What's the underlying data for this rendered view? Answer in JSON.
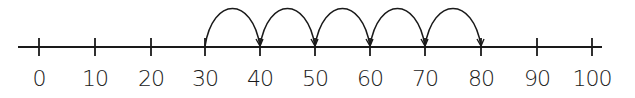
{
  "number_line": {
    "line": {
      "x_start": 18,
      "x_end": 602,
      "y": 47,
      "color": "#1a1a1a"
    },
    "ticks": [
      {
        "value": 0,
        "label": "0",
        "x": 39
      },
      {
        "value": 10,
        "label": "10",
        "x": 95
      },
      {
        "value": 20,
        "label": "20",
        "x": 151
      },
      {
        "value": 30,
        "label": "30",
        "x": 205
      },
      {
        "value": 40,
        "label": "40",
        "x": 260
      },
      {
        "value": 50,
        "label": "50",
        "x": 315
      },
      {
        "value": 60,
        "label": "60",
        "x": 370
      },
      {
        "value": 70,
        "label": "70",
        "x": 425
      },
      {
        "value": 80,
        "label": "80",
        "x": 481
      },
      {
        "value": 90,
        "label": "90",
        "x": 537
      },
      {
        "value": 100,
        "label": "100",
        "x": 592
      }
    ],
    "jumps": [
      {
        "from": 30,
        "to": 40
      },
      {
        "from": 40,
        "to": 50
      },
      {
        "from": 50,
        "to": 60
      },
      {
        "from": 60,
        "to": 70
      },
      {
        "from": 70,
        "to": 80
      }
    ],
    "jump_size": 10,
    "jump_count": 5,
    "start": 30,
    "end": 80
  }
}
